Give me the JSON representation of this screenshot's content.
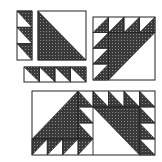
{
  "diagram": {
    "colors": {
      "background": "#ffffff",
      "outline": "#222222",
      "dark_fabric": "#3a3a3a",
      "dark_fabric_dots": "#8c8c8c",
      "light_fabric": "#ffffff"
    },
    "pieces": [
      {
        "id": "vertical-strip",
        "label": "Vertical strip of 3 half-square triangle units",
        "x": 17,
        "y": 11,
        "w": 15,
        "h": 49,
        "units": 3,
        "orientation": "vertical",
        "dark_side": "upper-right"
      },
      {
        "id": "large-triangle-square",
        "label": "Large half-square triangle",
        "x": 38,
        "y": 11,
        "w": 48,
        "h": 49,
        "dark_side": "lower-left"
      },
      {
        "id": "horizontal-strip",
        "label": "Horizontal strip of 4 half-square triangle units",
        "x": 24,
        "y": 67,
        "w": 62,
        "h": 15,
        "units": 4,
        "orientation": "horizontal",
        "dark_side": "upper-right"
      },
      {
        "id": "assembled-block-top-right",
        "label": "Assembled block: strips sewn to large triangle",
        "x": 93,
        "y": 17,
        "w": 62,
        "h": 63,
        "grid": 4
      },
      {
        "id": "paired-blocks-bottom",
        "label": "Two assembled blocks joined as mirror pair",
        "x": 32,
        "y": 91,
        "w": 123,
        "h": 64
      }
    ]
  }
}
